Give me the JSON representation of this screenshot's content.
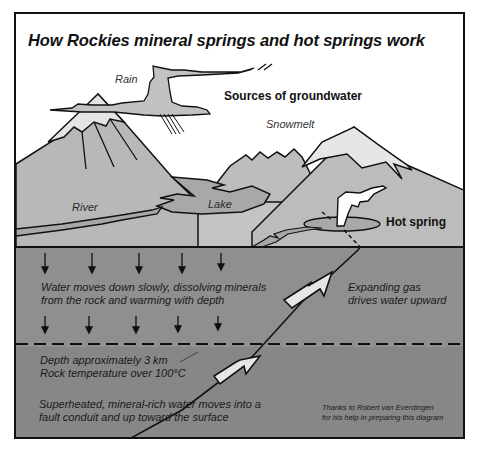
{
  "diagram": {
    "title": "How Rockies mineral springs and hot springs work",
    "labels": {
      "rain": "Rain",
      "sources": "Sources of groundwater",
      "snowmelt": "Snowmelt",
      "river": "River",
      "lake": "Lake",
      "hot_spring": "Hot spring"
    },
    "annotations": {
      "water_down_line1": "Water moves down slowly, dissolving minerals",
      "water_down_line2": "from the rock and warming with depth",
      "gas_line1": "Expanding gas",
      "gas_line2": "drives water upward",
      "depth_line1": "Depth approximately 3 km",
      "depth_line2": "Rock temperature over 100°C",
      "superheated_line1": "Superheated, mineral-rich water moves into a",
      "superheated_line2": "fault conduit and up toward the surface"
    },
    "credit": {
      "line1": "Thanks to Robert van Everdingen",
      "line2": "for his help in preparing this diagram"
    },
    "colors": {
      "sky": "#ffffff",
      "snow": "#e4e4e4",
      "mountain": "#b9b9b9",
      "water": "#a9a9a9",
      "upper_rock": "#8f8f8f",
      "deep_rock": "#878787",
      "outline": "#111111"
    }
  }
}
